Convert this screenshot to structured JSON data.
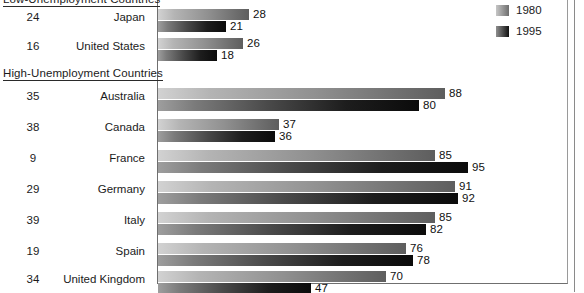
{
  "chart_data": {
    "type": "bar",
    "orientation": "horizontal",
    "title": "",
    "xlabel": "",
    "ylabel": "",
    "xlim": [
      0,
      100
    ],
    "grid": false,
    "legend_position": "top-right",
    "legend": [
      "1980",
      "1995"
    ],
    "series": [
      {
        "name": "1980",
        "values": [
          28,
          26,
          88,
          37,
          85,
          91,
          85,
          76,
          70
        ]
      },
      {
        "name": "1995",
        "values": [
          21,
          18,
          80,
          36,
          95,
          92,
          82,
          78,
          47
        ]
      }
    ],
    "categories": [
      "Japan",
      "United States",
      "Australia",
      "Canada",
      "France",
      "Germany",
      "Italy",
      "Spain",
      "United Kingdom"
    ],
    "rank_column": [
      24,
      16,
      35,
      38,
      9,
      29,
      39,
      19,
      34
    ],
    "groups": [
      {
        "header": "Low-Unemployment Countries",
        "categories": [
          "Japan",
          "United States"
        ]
      },
      {
        "header": "High-Unemployment Countries",
        "categories": [
          "Australia",
          "Canada",
          "France",
          "Germany",
          "Italy",
          "Spain",
          "United Kingdom"
        ]
      }
    ]
  },
  "headers": {
    "low": "Low-Unemployment Countries",
    "high": "High-Unemployment Countries"
  },
  "legend": {
    "items": [
      {
        "label": "1980",
        "swatch": "light-gray-gradient"
      },
      {
        "label": "1995",
        "swatch": "dark-gray-gradient"
      }
    ]
  },
  "rows": [
    {
      "rank": "24",
      "country": "Japan",
      "v1980": "28",
      "v1995": "21",
      "y1980": 9,
      "y1995": 21,
      "w1980": 91,
      "w1995": 68,
      "group": "low"
    },
    {
      "rank": "16",
      "country": "United States",
      "v1980": "26",
      "v1995": "18",
      "y1980": 38,
      "y1995": 50,
      "w1980": 85,
      "w1995": 59,
      "group": "low"
    },
    {
      "rank": "35",
      "country": "Australia",
      "v1980": "88",
      "v1995": "80",
      "y1980": 88,
      "y1995": 100,
      "w1980": 287,
      "w1995": 261,
      "group": "high"
    },
    {
      "rank": "38",
      "country": "Canada",
      "v1980": "37",
      "v1995": "36",
      "y1980": 119,
      "y1995": 131,
      "w1980": 121,
      "w1995": 117,
      "group": "high"
    },
    {
      "rank": "9",
      "country": "France",
      "v1980": "85",
      "v1995": "95",
      "y1980": 150,
      "y1995": 162,
      "w1980": 277,
      "w1995": 310,
      "group": "high"
    },
    {
      "rank": "29",
      "country": "Germany",
      "v1980": "91",
      "v1995": "92",
      "y1980": 181,
      "y1995": 193,
      "w1980": 297,
      "w1995": 300,
      "group": "high"
    },
    {
      "rank": "39",
      "country": "Italy",
      "v1980": "85",
      "v1995": "82",
      "y1980": 212,
      "y1995": 224,
      "w1980": 277,
      "w1995": 268,
      "group": "high"
    },
    {
      "rank": "19",
      "country": "Spain",
      "v1980": "76",
      "v1995": "78",
      "y1980": 243,
      "y1995": 255,
      "w1980": 248,
      "w1995": 255,
      "group": "high"
    },
    {
      "rank": "34",
      "country": "United Kingdom",
      "v1980": "70",
      "v1995": "47",
      "y1980": 271,
      "y1995": 283,
      "w1980": 228,
      "w1995": 153,
      "group": "high"
    }
  ],
  "colors": {
    "bar_1980_light": "#d2d2d2",
    "bar_1980_dark": "#5e5e5e",
    "bar_1995_light": "#9e9e9e",
    "bar_1995_dark": "#0b0b0b",
    "text": "#1b1b1b",
    "frame": "#6f6f6f",
    "background": "#ffffff"
  }
}
